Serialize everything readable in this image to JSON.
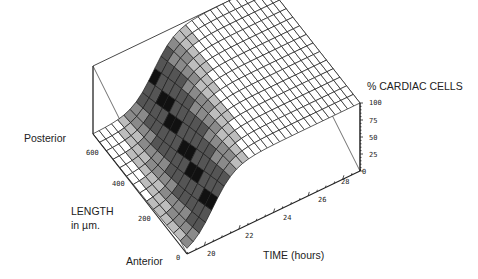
{
  "chart_data": {
    "type": "surface3d",
    "title": "",
    "zlabel": "% CARDIAC CELLS",
    "xlabel": "TIME (hours)",
    "ylabel": "LENGTH in µm.",
    "y_end_labels": {
      "high": "Posterior",
      "low": "Anterior"
    },
    "x_ticks": [
      "20",
      "22",
      "24",
      "26",
      "28"
    ],
    "y_ticks": [
      "0",
      "200",
      "400",
      "600"
    ],
    "z_ticks": [
      "0",
      "25",
      "50",
      "75",
      "100"
    ],
    "xlim": [
      19,
      29
    ],
    "ylim": [
      0,
      700
    ],
    "zlim": [
      0,
      100
    ],
    "surface_model": {
      "form": "logistic",
      "midpoint_hours_at_0um": 20.5,
      "midpoint_hours_at_700um": 22.5,
      "steepness": 1.6
    }
  },
  "labels": {
    "zaxis": "% CARDIAC CELLS",
    "posterior": "Posterior",
    "length_line1": "LENGTH",
    "length_line2": "in µm.",
    "anterior": "Anterior",
    "time": "TIME (hours)"
  },
  "ticks": {
    "z": [
      "100",
      "75",
      "50",
      "25",
      "0"
    ],
    "y": [
      "600",
      "400",
      "200",
      "0"
    ],
    "x": [
      "20",
      "22",
      "24",
      "26",
      "28"
    ]
  }
}
